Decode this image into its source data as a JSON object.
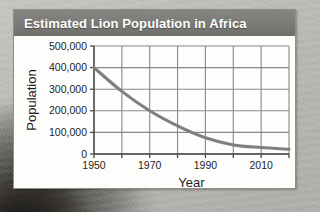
{
  "card": {
    "title": "Estimated Lion Population in Africa"
  },
  "colors": {
    "title_bar": "#7c7b77",
    "title_text": "#ffffff",
    "card_background": "#fdfdfc",
    "page_background": "#b9b8b4",
    "grid_line": "#8a8987",
    "axis_line": "#4a4a48",
    "series_line": "#807f7d",
    "tick_text": "#1d1d1d"
  },
  "chart_data": {
    "type": "line",
    "title": "Estimated Lion Population in Africa",
    "xlabel": "Year",
    "ylabel": "Population",
    "xlim": [
      1950,
      2020
    ],
    "ylim": [
      0,
      500000
    ],
    "grid": true,
    "legend": "none",
    "x_tick_labels": [
      "1950",
      "1970",
      "1990",
      "2010"
    ],
    "x_tick_values": [
      1950,
      1970,
      1990,
      2010
    ],
    "x_minor_ticks": [
      1960,
      1980,
      2000,
      2020
    ],
    "y_tick_labels": [
      "0",
      "100,000",
      "200,000",
      "300,000",
      "400,000",
      "500,000"
    ],
    "y_tick_values": [
      0,
      100000,
      200000,
      300000,
      400000,
      500000
    ],
    "series": [
      {
        "name": "Estimated lion population",
        "x": [
          1950,
          1960,
          1970,
          1980,
          1990,
          2000,
          2010,
          2020
        ],
        "values": [
          400000,
          290000,
          200000,
          130000,
          75000,
          42000,
          30000,
          22000
        ]
      }
    ]
  }
}
